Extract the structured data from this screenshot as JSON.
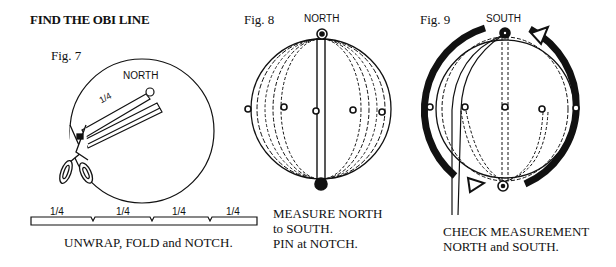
{
  "title": "FIND THE OBI LINE",
  "fig7": {
    "label": "Fig. 7",
    "north_label": "NORTH",
    "strip_label": "1/4",
    "segment_labels": [
      "1/4",
      "1/4",
      "1/4",
      "1/4"
    ],
    "caption": "UNWRAP, FOLD and NOTCH."
  },
  "fig8": {
    "label": "Fig. 8",
    "north_label": "NORTH",
    "caption_lines": [
      "MEASURE NORTH",
      "to SOUTH.",
      "PIN at NOTCH."
    ]
  },
  "fig9": {
    "label": "Fig. 9",
    "south_label": "SOUTH",
    "caption_lines": [
      "CHECK MEASUREMENT",
      "NORTH and SOUTH."
    ]
  }
}
